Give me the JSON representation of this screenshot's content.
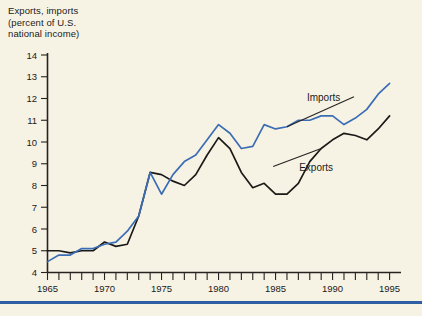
{
  "title": "Exports, imports\n(percent of U.S.\nnational income)",
  "colors": {
    "background": "#f7f3e4",
    "axis": "#262220",
    "exports_line": "#1c1a18",
    "imports_line": "#3b6db5",
    "rule": "#2e5fa3"
  },
  "labels": {
    "imports": "Imports",
    "exports": "Exports"
  },
  "chart_data": {
    "type": "line",
    "title": "Exports, imports (percent of U.S. national income)",
    "xlabel": "",
    "ylabel": "Exports, imports (percent of U.S. national income)",
    "xlim": [
      1965,
      1996
    ],
    "ylim": [
      4,
      14
    ],
    "yticks": [
      4,
      5,
      6,
      7,
      8,
      9,
      10,
      11,
      12,
      13,
      14
    ],
    "ytick_labels": [
      "4",
      "5",
      "6",
      "7",
      "8",
      "9",
      "10",
      "11",
      "12",
      "13",
      "14"
    ],
    "xticks": [
      1965,
      1966,
      1967,
      1968,
      1969,
      1970,
      1971,
      1972,
      1973,
      1974,
      1975,
      1976,
      1977,
      1978,
      1979,
      1980,
      1981,
      1982,
      1983,
      1984,
      1985,
      1986,
      1987,
      1988,
      1989,
      1990,
      1991,
      1992,
      1993,
      1994,
      1995
    ],
    "xtick_labels_shown": [
      "1965",
      "1970",
      "1975",
      "1980",
      "1985",
      "1990",
      "1995"
    ],
    "grid": false,
    "legend": "inline-annotations",
    "x": [
      1965,
      1966,
      1967,
      1968,
      1969,
      1970,
      1971,
      1972,
      1973,
      1974,
      1975,
      1976,
      1977,
      1978,
      1979,
      1980,
      1981,
      1982,
      1983,
      1984,
      1985,
      1986,
      1987,
      1988,
      1989,
      1990,
      1991,
      1992,
      1993,
      1994,
      1995
    ],
    "series": [
      {
        "name": "Exports",
        "color": "#1c1a18",
        "values": [
          5.0,
          5.0,
          4.9,
          5.0,
          5.0,
          5.4,
          5.2,
          5.3,
          6.6,
          8.6,
          8.5,
          8.2,
          8.0,
          8.5,
          9.4,
          10.2,
          9.7,
          8.6,
          7.9,
          8.1,
          7.6,
          7.6,
          8.1,
          9.1,
          9.7,
          10.1,
          10.4,
          10.3,
          10.1,
          10.6,
          11.2
        ]
      },
      {
        "name": "Imports",
        "color": "#3b6db5",
        "values": [
          4.5,
          4.8,
          4.8,
          5.1,
          5.1,
          5.3,
          5.4,
          5.9,
          6.6,
          8.6,
          7.6,
          8.5,
          9.1,
          9.4,
          10.1,
          10.8,
          10.4,
          9.7,
          9.8,
          10.8,
          10.6,
          10.7,
          11.0,
          11.0,
          11.2,
          11.2,
          10.8,
          11.1,
          11.5,
          12.2,
          12.7
        ]
      }
    ],
    "annotations": [
      {
        "text": "Imports",
        "series": "Imports",
        "x": 1986
      },
      {
        "text": "Exports",
        "series": "Exports",
        "x": 1989
      }
    ]
  }
}
